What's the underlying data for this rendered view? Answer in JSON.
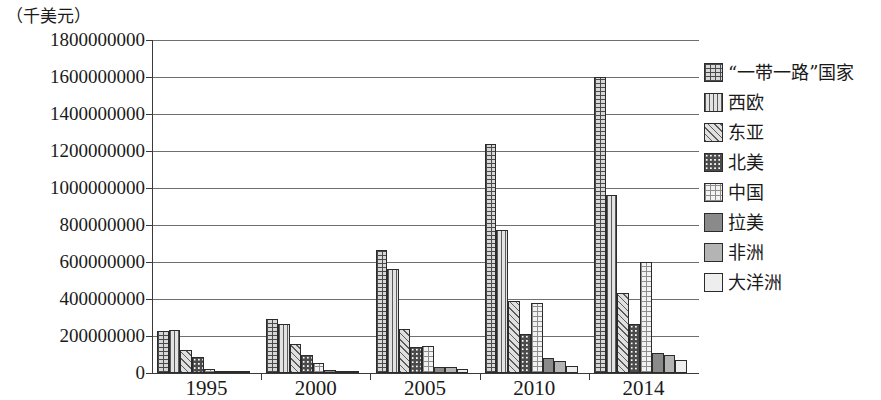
{
  "chart_data": {
    "type": "bar",
    "title": "",
    "subtitle": "",
    "xlabel": "",
    "ylabel": "（千美元）",
    "y_unit_caption": "（千美元）",
    "categories": [
      "1995",
      "2000",
      "2005",
      "2010",
      "2014"
    ],
    "ylim": [
      0,
      1800000000
    ],
    "ytick_step": 200000000,
    "ytick_labels": [
      "1800000000",
      "1600000000",
      "1400000000",
      "1200000000",
      "1000000000",
      "800000000",
      "600000000",
      "400000000",
      "200000000",
      "0"
    ],
    "ytick_values": [
      1800000000,
      1600000000,
      1400000000,
      1200000000,
      1000000000,
      800000000,
      600000000,
      400000000,
      200000000,
      0
    ],
    "grid": true,
    "grid_axis": "y",
    "legend_position": "right",
    "series": [
      {
        "name": "“一带一路”国家",
        "pattern": "brick",
        "values": [
          225000000,
          290000000,
          665000000,
          1240000000,
          1600000000
        ]
      },
      {
        "name": "西欧",
        "pattern": "vertical-lines",
        "values": [
          230000000,
          265000000,
          560000000,
          775000000,
          960000000
        ]
      },
      {
        "name": "东亚",
        "pattern": "diagonal-hatch",
        "values": [
          125000000,
          155000000,
          240000000,
          390000000,
          430000000
        ]
      },
      {
        "name": "北美",
        "pattern": "dark-dots",
        "values": [
          85000000,
          100000000,
          140000000,
          210000000,
          265000000
        ]
      },
      {
        "name": "中国",
        "pattern": "checker",
        "values": [
          20000000,
          55000000,
          145000000,
          380000000,
          600000000
        ]
      },
      {
        "name": "拉美",
        "pattern": "solid-dark-gray",
        "values": [
          12000000,
          18000000,
          35000000,
          80000000,
          110000000
        ]
      },
      {
        "name": "非洲",
        "pattern": "solid-mid-gray",
        "values": [
          8000000,
          13000000,
          30000000,
          65000000,
          95000000
        ]
      },
      {
        "name": "大洋洲",
        "pattern": "solid-light-gray",
        "values": [
          5000000,
          10000000,
          22000000,
          40000000,
          70000000
        ]
      }
    ]
  },
  "legend": {
    "items": [
      {
        "label": "“一带一路”国家",
        "swatch": "brick"
      },
      {
        "label": "西欧",
        "swatch": "vertical-lines"
      },
      {
        "label": "东亚",
        "swatch": "diagonal-hatch"
      },
      {
        "label": "北美",
        "swatch": "dark-dots"
      },
      {
        "label": "中国",
        "swatch": "checker"
      },
      {
        "label": "拉美",
        "swatch": "solid-dark-gray"
      },
      {
        "label": "非洲",
        "swatch": "solid-mid-gray"
      },
      {
        "label": "大洋洲",
        "swatch": "solid-light-gray"
      }
    ]
  },
  "colors": {
    "axis": "#3a3a3a",
    "grid": "#6f6f6f",
    "text": "#1a1a1a",
    "bar_outline": "#2b2b2b"
  }
}
